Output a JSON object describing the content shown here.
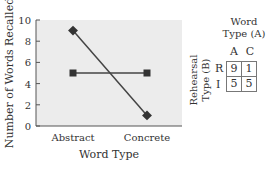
{
  "chart_data": {
    "type": "line",
    "title": "",
    "xlabel": "Word Type",
    "ylabel": "Number of Words Recalled",
    "categories": [
      "Abstract",
      "Concrete"
    ],
    "series": [
      {
        "name": "R (diamond)",
        "marker": "diamond",
        "values": [
          9,
          1
        ]
      },
      {
        "name": "I (square)",
        "marker": "square",
        "values": [
          5,
          5
        ]
      }
    ],
    "ylim": [
      0,
      10
    ],
    "yticks": [
      0,
      2,
      4,
      6,
      8,
      10
    ],
    "grid": false,
    "legend": "none",
    "colors": {
      "plot_bg": "#ececec",
      "line": "#444444",
      "marker": "#333333"
    }
  },
  "table": {
    "col_header_title": [
      "Word",
      "Type (A)"
    ],
    "row_header_title": [
      "Rehearsal",
      "Type (B)"
    ],
    "columns": [
      "A",
      "C"
    ],
    "rows": [
      {
        "label": "R",
        "values": [
          "9",
          "1"
        ]
      },
      {
        "label": "I",
        "values": [
          "5",
          "5"
        ]
      }
    ]
  }
}
